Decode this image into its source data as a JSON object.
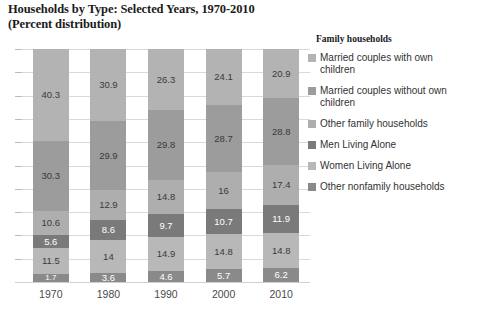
{
  "title": {
    "line1": "Households by Type: Selected Years, 1970-2010",
    "line2": "(Percent distribution)"
  },
  "legend": {
    "heading": "Family households",
    "items": [
      {
        "label": "Married couples with own children",
        "color": "#b3b3b3"
      },
      {
        "label": "Married couples without own children",
        "color": "#9c9c9c"
      },
      {
        "label": "Other family households",
        "color": "#aeaeae"
      },
      {
        "label": "Men Living Alone",
        "color": "#7a7a7a"
      },
      {
        "label": "Women Living Alone",
        "color": "#b8b8b8"
      },
      {
        "label": "Other nonfamily households",
        "color": "#8a8a8a"
      }
    ]
  },
  "chart_data": {
    "type": "bar",
    "stacked": true,
    "title": "Households by Type: Selected Years, 1970-2010 (Percent distribution)",
    "xlabel": "",
    "ylabel": "",
    "ylim": [
      0,
      100
    ],
    "grid": true,
    "legend_position": "right",
    "categories": [
      "1970",
      "1980",
      "1990",
      "2000",
      "2010"
    ],
    "series": [
      {
        "name": "Married couples with own children",
        "color": "#b3b3b3",
        "values": [
          40.3,
          30.9,
          26.3,
          24.1,
          20.9
        ]
      },
      {
        "name": "Married couples without own children",
        "color": "#9c9c9c",
        "values": [
          30.3,
          29.9,
          29.8,
          28.7,
          28.8
        ]
      },
      {
        "name": "Other family households",
        "color": "#aeaeae",
        "values": [
          10.6,
          12.9,
          14.8,
          16,
          17.4
        ]
      },
      {
        "name": "Men Living Alone",
        "color": "#7a7a7a",
        "values": [
          5.6,
          8.6,
          9.7,
          10.7,
          11.9
        ]
      },
      {
        "name": "Women Living Alone",
        "color": "#b8b8b8",
        "values": [
          11.5,
          14,
          14.9,
          14.8,
          14.8
        ]
      },
      {
        "name": "Other nonfamily households",
        "color": "#8a8a8a",
        "values": [
          1.7,
          3.6,
          4.6,
          5.7,
          6.2
        ]
      }
    ],
    "bar_labels": {
      "1970": [
        "40.3",
        "30.3",
        "10.6",
        "5.6",
        "11.5",
        "1.7"
      ],
      "1980": [
        "30.9",
        "29.9",
        "12.9",
        "8.6",
        "14",
        "3.6"
      ],
      "1990": [
        "26.3",
        "29.8",
        "14.8",
        "9.7",
        "14.9",
        "4.6"
      ],
      "2000": [
        "24.1",
        "28.7",
        "16",
        "10.7",
        "14.8",
        "5.7"
      ],
      "2010": [
        "20.9",
        "28.8",
        "17.4",
        "11.9",
        "14.8",
        "6.2"
      ]
    },
    "x_tick_labels": [
      "1970",
      "1980",
      "1990",
      "2000",
      "2010"
    ]
  }
}
